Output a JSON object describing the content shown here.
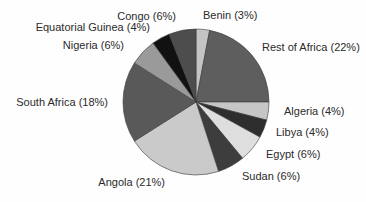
{
  "chart_data": {
    "type": "pie",
    "title": "",
    "value_unit": "percent",
    "total": 100,
    "start_angle": "12-oclock",
    "direction": "clockwise",
    "legend_position": "none",
    "labels_style": "around-pie-no-leader-lines",
    "outline_color": "#3a3a3a",
    "background_color": "#fefefe",
    "slices": [
      {
        "label": "Benin",
        "value": 3,
        "display": "Benin (3%)",
        "color": "#c4c4c4"
      },
      {
        "label": "Rest of Africa",
        "value": 22,
        "display": "Rest of Africa (22%)",
        "color": "#5e5e5e"
      },
      {
        "label": "Algeria",
        "value": 4,
        "display": "Algeria (4%)",
        "color": "#c6c6c6"
      },
      {
        "label": "Libya",
        "value": 4,
        "display": "Libya (4%)",
        "color": "#2e2e2e"
      },
      {
        "label": "Egypt",
        "value": 6,
        "display": "Egypt (6%)",
        "color": "#dedede"
      },
      {
        "label": "Sudan",
        "value": 6,
        "display": "Sudan (6%)",
        "color": "#3d3d3d"
      },
      {
        "label": "Angola",
        "value": 21,
        "display": "Angola (21%)",
        "color": "#cacaca"
      },
      {
        "label": "South Africa",
        "value": 18,
        "display": "South Africa (18%)",
        "color": "#595959"
      },
      {
        "label": "Nigeria",
        "value": 6,
        "display": "Nigeria (6%)",
        "color": "#9a9a9a"
      },
      {
        "label": "Equatorial Guinea",
        "value": 4,
        "display": "Equatorial Guinea (4%)",
        "color": "#111111"
      },
      {
        "label": "Congo",
        "value": 6,
        "display": "Congo (6%)",
        "color": "#4d4d4d"
      }
    ]
  }
}
